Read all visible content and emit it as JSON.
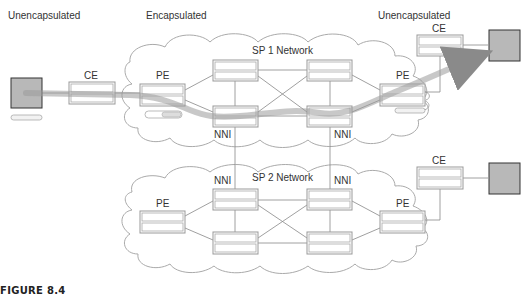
{
  "labels": {
    "left_unencapsulated": "Unencapsulated",
    "encapsulated": "Encapsulated",
    "right_unencapsulated": "Unencapsulated",
    "sp1_network": "SP 1 Network",
    "sp2_network": "SP 2 Network",
    "ce_left": "CE",
    "pe_sp1_left": "PE",
    "pe_sp1_right": "PE",
    "ce_right_top": "CE",
    "nni_sp1_left": "NNI",
    "nni_sp1_right": "NNI",
    "nni_sp2_left": "NNI",
    "nni_sp2_right": "NNI",
    "pe_sp2_left": "PE",
    "pe_sp2_right": "PE",
    "ce_right_bottom": "CE"
  },
  "caption": "FIGURE 8.4",
  "colors": {
    "device_border": "#999999",
    "host_fill": "#b8b8b8",
    "host_border": "#333333",
    "cloud_stroke": "#aaaaaa",
    "link": "#888888",
    "path": "#9a9a9a"
  }
}
